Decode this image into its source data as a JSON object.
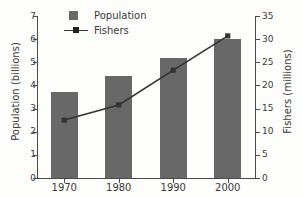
{
  "chart_data": {
    "type": "bar",
    "title": "",
    "categories": [
      "1970",
      "1980",
      "1990",
      "2000"
    ],
    "series": [
      {
        "name": "Population",
        "unit": "billions",
        "axis": "left",
        "type": "bar",
        "values": [
          3.7,
          4.4,
          5.2,
          6.0
        ],
        "color": "#686868"
      },
      {
        "name": "Fishers",
        "unit": "millions",
        "axis": "right",
        "type": "line",
        "values": [
          12.5,
          15.8,
          23.3,
          30.7
        ],
        "color": "#333333"
      }
    ],
    "xlabel": "",
    "ylabel": "Population (billions)",
    "y2label": "Fishers (millions)",
    "ylim": [
      0,
      7
    ],
    "y2lim": [
      0,
      35
    ],
    "yticks": [
      "7",
      "6",
      "5",
      "4",
      "3",
      "2",
      "1",
      "0"
    ],
    "y2ticks": [
      "35",
      "30",
      "25",
      "20",
      "15",
      "10",
      "5",
      "0"
    ],
    "grid": false,
    "legend_position": "top-left"
  },
  "legend": {
    "items": [
      {
        "label": "Population",
        "marker": "square-swatch"
      },
      {
        "label": "Fishers",
        "marker": "line-with-square-marker"
      }
    ]
  }
}
